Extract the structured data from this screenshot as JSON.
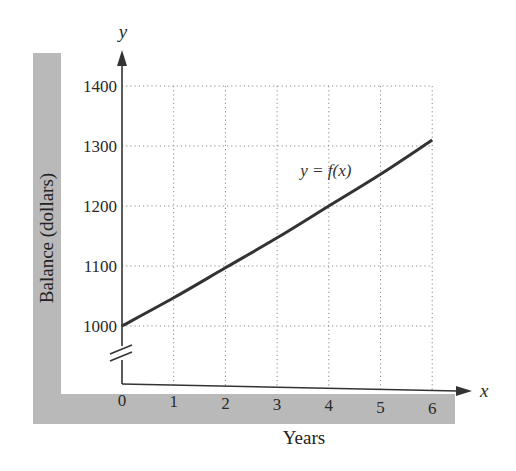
{
  "chart_data": {
    "type": "line",
    "title": "",
    "xlabel": "Years",
    "ylabel": "Balance (dollars)",
    "x_axis_symbol": "x",
    "y_axis_symbol": "y",
    "xlim": [
      0,
      6
    ],
    "ylim": [
      1000,
      1400
    ],
    "y_axis_break": true,
    "grid": true,
    "x_ticks": [
      "0",
      "1",
      "2",
      "3",
      "4",
      "5",
      "6"
    ],
    "y_ticks": [
      "1000",
      "1100",
      "1200",
      "1300",
      "1400"
    ],
    "series": [
      {
        "name": "y = f(x)",
        "x": [
          0,
          1,
          2,
          3,
          4,
          5,
          6
        ],
        "values": [
          1000,
          1047,
          1097,
          1147,
          1200,
          1253,
          1310
        ]
      }
    ],
    "annotations": [
      {
        "text": "y = f(x)",
        "x": 4.0,
        "y": 1260
      }
    ]
  }
}
